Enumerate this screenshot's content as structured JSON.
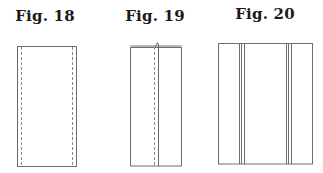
{
  "figures": [
    {
      "title": "Fig. 18",
      "description": "Rectangle with two dashed stitch lines near left and right edges",
      "rect": {
        "x": 17,
        "y": 46,
        "w": 59,
        "h": 120
      },
      "dashed_lines_x": [
        21,
        72
      ]
    },
    {
      "title": "Fig. 19",
      "description": "Rectangle folded with a center seam: dashed stitch line beside a solid fold line, double top edge with small fold tab",
      "rect": {
        "x": 130,
        "y": 47,
        "w": 51,
        "h": 119
      },
      "dashed_lines_x": [
        154
      ],
      "solid_lines_x": [
        158
      ]
    },
    {
      "title": "Fig. 20",
      "description": "Wider rectangle with two groups of triple vertical lines (pleats/tucks)",
      "rect": {
        "x": 218,
        "y": 43,
        "w": 94,
        "h": 121
      },
      "line_groups_x": [
        [
          239,
          241,
          244
        ],
        [
          286,
          288,
          291
        ]
      ]
    }
  ],
  "colors": {
    "stroke": "#6e6e6e",
    "dash": "#8a8a8a",
    "title": "#1a1a1a"
  }
}
